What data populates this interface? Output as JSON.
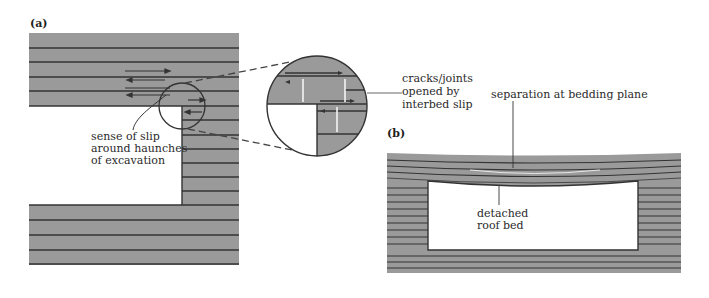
{
  "figure": {
    "panel_a": {
      "label": "(a)",
      "annotations": {
        "slip_line1": "sense of slip",
        "slip_line2": "around haunches",
        "slip_line3": "of excavation",
        "cracks_line1": "cracks/joints",
        "cracks_line2": "opened by",
        "cracks_line3": "interbed slip"
      }
    },
    "panel_b": {
      "label": "(b)",
      "annotations": {
        "separation": "separation at bedding plane",
        "roof_line1": "detached",
        "roof_line2": "roof bed"
      }
    },
    "colors": {
      "rock_fill": "#9a9a9a",
      "bedding_line": "#333333",
      "opening_fill": "#ffffff",
      "background": "#ffffff"
    }
  }
}
